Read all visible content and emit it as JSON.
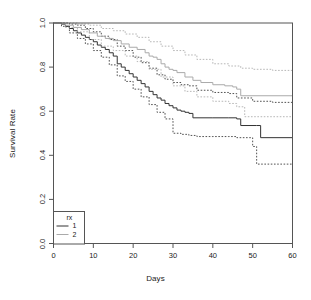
{
  "chart_data": {
    "type": "line",
    "title": "",
    "subtitle": "",
    "xlabel": "Days",
    "ylabel": "Survival Rate",
    "xlim": [
      0,
      60
    ],
    "ylim": [
      0,
      1
    ],
    "xticks": [
      0,
      10,
      20,
      30,
      40,
      50,
      60
    ],
    "xtick_labels": [
      "0",
      "10",
      "20",
      "30",
      "40",
      "50",
      "60"
    ],
    "yticks": [
      0.0,
      0.2,
      0.4,
      0.6,
      0.8,
      1.0
    ],
    "ytick_labels": [
      "0.0",
      "0.2",
      "0.4",
      "0.6",
      "0.8",
      "1.0"
    ],
    "grid": false,
    "box": true,
    "legend": {
      "title": "rx",
      "position": "bottom-left",
      "entries": [
        {
          "label": "1",
          "color": "#333333",
          "style": "solid"
        },
        {
          "label": "2",
          "color": "#aaaaaa",
          "style": "solid"
        }
      ]
    },
    "series": [
      {
        "name": "1",
        "label": "rx = 1",
        "color": "#333333",
        "style": "solid",
        "kind": "step",
        "x": [
          0,
          2,
          3,
          4,
          5,
          6,
          7,
          8,
          9,
          10,
          11,
          12,
          13,
          14,
          15,
          16,
          17,
          18,
          19,
          20,
          21,
          22,
          23,
          24,
          25,
          26,
          27,
          28,
          29,
          30,
          31,
          32,
          33,
          34,
          35,
          40,
          44,
          46,
          47,
          51,
          52,
          60
        ],
        "y": [
          1.0,
          0.995,
          0.985,
          0.975,
          0.965,
          0.955,
          0.945,
          0.935,
          0.925,
          0.915,
          0.9,
          0.89,
          0.88,
          0.865,
          0.85,
          0.815,
          0.8,
          0.785,
          0.77,
          0.755,
          0.74,
          0.725,
          0.71,
          0.69,
          0.675,
          0.66,
          0.65,
          0.635,
          0.625,
          0.615,
          0.605,
          0.6,
          0.595,
          0.59,
          0.57,
          0.57,
          0.57,
          0.565,
          0.535,
          0.535,
          0.48,
          0.48
        ]
      },
      {
        "name": "1-upper-ci",
        "label": "rx = 1 upper 95% CI",
        "color": "#333333",
        "style": "dotted",
        "kind": "step",
        "x": [
          0,
          2,
          4,
          6,
          8,
          10,
          12,
          14,
          16,
          18,
          20,
          22,
          24,
          26,
          28,
          30,
          32,
          34,
          36,
          40,
          44,
          46,
          50,
          55,
          60
        ],
        "y": [
          1.0,
          1.0,
          0.995,
          0.99,
          0.975,
          0.96,
          0.94,
          0.925,
          0.895,
          0.875,
          0.845,
          0.82,
          0.795,
          0.765,
          0.745,
          0.73,
          0.72,
          0.715,
          0.695,
          0.685,
          0.68,
          0.66,
          0.645,
          0.64,
          0.64
        ]
      },
      {
        "name": "1-lower-ci",
        "label": "rx = 1 lower 95% CI",
        "color": "#333333",
        "style": "dotted",
        "kind": "step",
        "x": [
          0,
          2,
          4,
          6,
          8,
          10,
          12,
          14,
          16,
          18,
          20,
          22,
          24,
          26,
          28,
          30,
          32,
          34,
          36,
          40,
          44,
          46,
          50,
          51,
          55,
          60
        ],
        "y": [
          1.0,
          0.985,
          0.955,
          0.93,
          0.905,
          0.875,
          0.845,
          0.81,
          0.76,
          0.735,
          0.7,
          0.665,
          0.63,
          0.595,
          0.565,
          0.5,
          0.495,
          0.49,
          0.485,
          0.485,
          0.485,
          0.48,
          0.44,
          0.36,
          0.36,
          0.36
        ]
      },
      {
        "name": "2",
        "label": "rx = 2",
        "color": "#aaaaaa",
        "style": "solid",
        "kind": "step",
        "x": [
          0,
          3,
          5,
          7,
          9,
          11,
          13,
          15,
          17,
          19,
          21,
          23,
          24,
          25,
          26,
          27,
          28,
          29,
          30,
          31,
          33,
          35,
          37,
          40,
          43,
          45,
          46,
          47,
          60
        ],
        "y": [
          1.0,
          0.99,
          0.98,
          0.97,
          0.955,
          0.94,
          0.93,
          0.92,
          0.905,
          0.89,
          0.88,
          0.865,
          0.85,
          0.845,
          0.835,
          0.815,
          0.8,
          0.79,
          0.785,
          0.775,
          0.755,
          0.74,
          0.73,
          0.72,
          0.715,
          0.71,
          0.7,
          0.67,
          0.67
        ]
      },
      {
        "name": "2-upper-ci",
        "label": "rx = 2 upper 95% CI",
        "color": "#aaaaaa",
        "style": "dotted",
        "kind": "step",
        "x": [
          0,
          3,
          6,
          9,
          12,
          15,
          18,
          21,
          24,
          27,
          30,
          33,
          36,
          40,
          44,
          47,
          50,
          55,
          60
        ],
        "y": [
          1.0,
          1.0,
          0.995,
          0.99,
          0.975,
          0.965,
          0.95,
          0.935,
          0.915,
          0.895,
          0.875,
          0.855,
          0.835,
          0.815,
          0.805,
          0.795,
          0.79,
          0.785,
          0.785
        ]
      },
      {
        "name": "2-lower-ci",
        "label": "rx = 2 lower 95% CI",
        "color": "#aaaaaa",
        "style": "dotted",
        "kind": "step",
        "x": [
          0,
          3,
          6,
          9,
          12,
          15,
          18,
          21,
          24,
          27,
          30,
          33,
          36,
          40,
          44,
          46,
          48,
          55,
          60
        ],
        "y": [
          1.0,
          0.98,
          0.96,
          0.925,
          0.895,
          0.875,
          0.85,
          0.825,
          0.79,
          0.755,
          0.715,
          0.69,
          0.665,
          0.645,
          0.635,
          0.62,
          0.575,
          0.575,
          0.575
        ]
      }
    ]
  },
  "figure": {
    "background": "#ffffff",
    "axis_color": "#555555",
    "text_color": "#1a1a1a"
  }
}
